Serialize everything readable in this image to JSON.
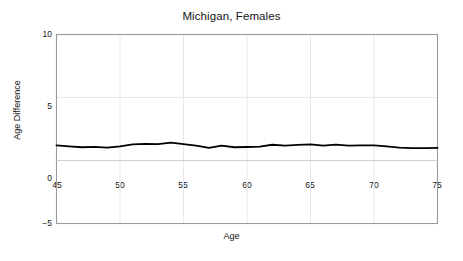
{
  "chart_data": {
    "type": "line",
    "title": "Michigan, Females",
    "xlabel": "Age",
    "ylabel": "Age Difference",
    "xlim": [
      45,
      75
    ],
    "ylim": [
      -5,
      10
    ],
    "xticks": [
      45,
      50,
      55,
      60,
      65,
      70,
      75
    ],
    "yticks": [
      -5,
      0,
      5,
      10
    ],
    "grid": true,
    "legend": "none",
    "line_color": "#000000",
    "frame_color": "#9a9a9a",
    "grid_color": "#e8e8e8",
    "series": [
      {
        "name": "Age Difference",
        "x": [
          45,
          46,
          47,
          48,
          49,
          50,
          51,
          52,
          53,
          54,
          55,
          56,
          57,
          58,
          59,
          60,
          61,
          62,
          63,
          64,
          65,
          66,
          67,
          68,
          69,
          70,
          71,
          72,
          73,
          74,
          75
        ],
        "values": [
          1.2,
          1.12,
          1.05,
          1.08,
          1.02,
          1.12,
          1.28,
          1.32,
          1.3,
          1.42,
          1.3,
          1.18,
          1.0,
          1.18,
          1.05,
          1.07,
          1.1,
          1.25,
          1.18,
          1.24,
          1.28,
          1.18,
          1.26,
          1.18,
          1.2,
          1.2,
          1.12,
          1.02,
          0.98,
          0.98,
          1.0
        ]
      }
    ]
  },
  "axes": {
    "ytick_labels": [
      "10",
      "5",
      "0",
      "−5"
    ],
    "xtick_labels": [
      "45",
      "50",
      "55",
      "60",
      "65",
      "70",
      "75"
    ]
  }
}
